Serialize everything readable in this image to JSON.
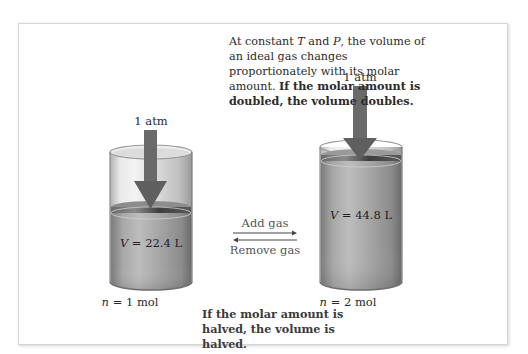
{
  "caption": {
    "line1_pre": "At constant ",
    "var_T": "T",
    "line1_mid": " and ",
    "var_P": "P",
    "line1_post": ", the volume of an ideal gas changes proportionately with its molar amount.",
    "bold": "If the molar amount is doubled, the volume doubles."
  },
  "left_cylinder": {
    "pressure_label": "1 atm",
    "volume_var": "V",
    "volume_value": " = 22.4 L",
    "moles_var": "n",
    "moles_value": " = 1 mol"
  },
  "right_cylinder": {
    "pressure_label": "1 atm",
    "volume_var": "V",
    "volume_value": " = 44.8 L",
    "moles_var": "n",
    "moles_value": " = 2 mol"
  },
  "process_arrows": {
    "forward_label": "Add gas",
    "reverse_label": "Remove gas"
  },
  "bottom_note": "If the molar amount is halved, the volume is halved.",
  "colors": {
    "arrow": "#6a6a6a",
    "cylinder_glass": "#c8c8c8",
    "gas": "#9a9a9a",
    "piston": "#4e4e4e"
  }
}
